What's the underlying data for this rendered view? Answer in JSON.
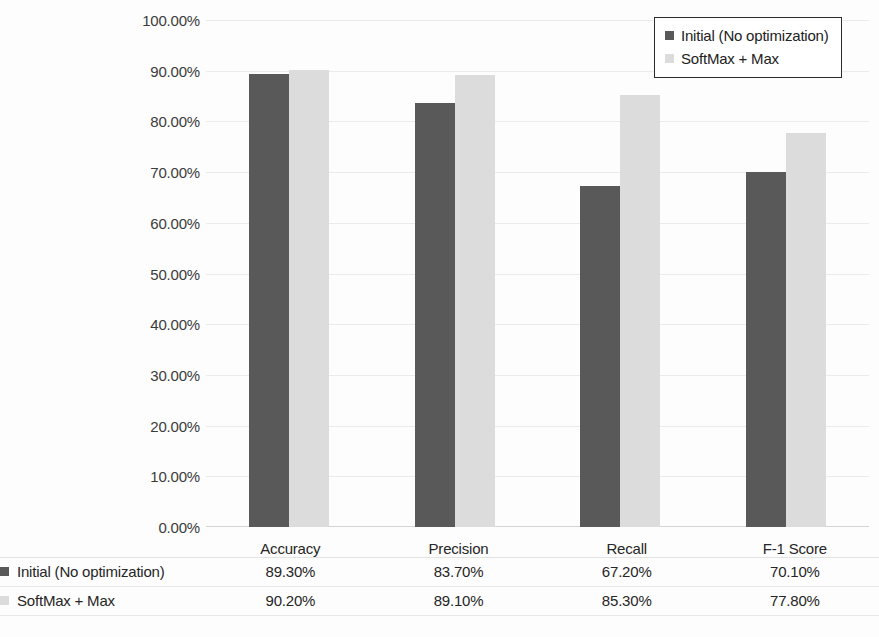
{
  "chart_data": {
    "type": "bar",
    "title": "",
    "subtitle": "",
    "xlabel": "",
    "ylabel": "",
    "categories": [
      "Accuracy",
      "Precision",
      "Recall",
      "F-1 Score"
    ],
    "series": [
      {
        "name": "Initial (No optimization)",
        "color": "#595959",
        "values": [
          89.3,
          83.7,
          67.2,
          70.1
        ],
        "labels": [
          "89.30%",
          "83.70%",
          "67.20%",
          "70.10%"
        ]
      },
      {
        "name": "SoftMax + Max",
        "color": "#dcdcdc",
        "values": [
          90.2,
          89.1,
          85.3,
          77.8
        ],
        "labels": [
          "90.20%",
          "89.10%",
          "85.30%",
          "77.80%"
        ]
      }
    ],
    "ylim": [
      0,
      100
    ],
    "ytick_values": [
      0,
      10,
      20,
      30,
      40,
      50,
      60,
      70,
      80,
      90,
      100
    ],
    "ytick_labels": [
      "0.00%",
      "10.00%",
      "20.00%",
      "30.00%",
      "40.00%",
      "50.00%",
      "60.00%",
      "70.00%",
      "80.00%",
      "90.00%",
      "100.00%"
    ],
    "grid": true,
    "legend_position": "top-right",
    "value_suffix": "%",
    "has_data_table": true
  },
  "legend": {
    "items": [
      {
        "label": "Initial (No optimization)",
        "swatch": "#595959"
      },
      {
        "label": "SoftMax + Max",
        "swatch": "#dcdcdc"
      }
    ]
  },
  "data_table": {
    "corner_label": "",
    "column_headers": [
      "Accuracy",
      "Precision",
      "Recall",
      "F-1 Score"
    ],
    "rows": [
      {
        "label": "Initial (No optimization)",
        "swatch": "#595959",
        "cells": [
          "89.30%",
          "83.70%",
          "67.20%",
          "70.10%"
        ]
      },
      {
        "label": "SoftMax + Max",
        "swatch": "#dcdcdc",
        "cells": [
          "90.20%",
          "89.10%",
          "85.30%",
          "77.80%"
        ]
      }
    ]
  }
}
